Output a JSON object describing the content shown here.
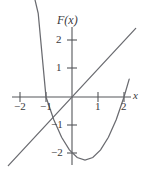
{
  "chart_data": {
    "type": "line",
    "title": "F(x)",
    "xlabel": "x",
    "ylabel": "F(x)",
    "xlim": [
      -2.5,
      2.6
    ],
    "ylim": [
      -2.6,
      2.5
    ],
    "grid": false,
    "legend": "none",
    "x_ticks": [
      -2,
      -1,
      1,
      2
    ],
    "x_tick_labels": [
      "−2",
      "−1",
      "1",
      "2"
    ],
    "y_ticks": [
      -2,
      -1,
      1,
      2
    ],
    "y_tick_labels": [
      "−2",
      "−1",
      "1",
      "2"
    ],
    "series": [
      {
        "name": "parabola",
        "equation": "y = x^2 - x - 2",
        "vertex": [
          0.5,
          -2.25
        ],
        "roots": [
          -1,
          2
        ],
        "x": [
          -1.9,
          -1.6,
          -1.3,
          -1.0,
          -0.7,
          -0.4,
          -0.1,
          0.2,
          0.5,
          0.8,
          1.1,
          1.4,
          1.7,
          2.0,
          2.2
        ],
        "values": [
          5.51,
          4.16,
          2.99,
          0.0,
          -0.81,
          -1.44,
          -1.89,
          -2.16,
          -2.25,
          -2.16,
          -1.89,
          -1.44,
          -0.81,
          0.0,
          0.64
        ]
      },
      {
        "name": "line",
        "equation": "y = x",
        "slope": 1,
        "intercept": 0,
        "x": [
          -2.45,
          2.45
        ],
        "values": [
          -2.45,
          2.45
        ]
      }
    ],
    "intersections": [
      [
        -1,
        -1
      ],
      [
        2,
        2
      ]
    ],
    "axis_color": "#55565a",
    "curve_color": "#6a6b70",
    "background": "#ffffff"
  },
  "labels": {
    "title": "F(x)",
    "x_axis": "x",
    "x_ticks": {
      "minus_two": "−2",
      "minus_one": "−1",
      "plus_one": "1",
      "plus_two": "2"
    },
    "y_ticks": {
      "plus_two": "2",
      "plus_one": "1",
      "minus_one": "−1",
      "minus_two": "−2"
    }
  }
}
